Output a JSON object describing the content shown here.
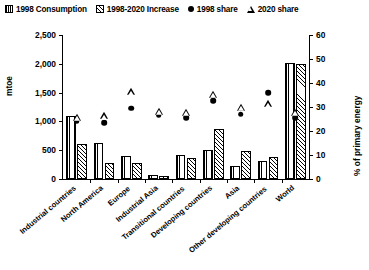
{
  "legend": {
    "items": [
      {
        "label": "1998 Consumption",
        "marker": "vertical-stripe-square"
      },
      {
        "label": "1998-2020 Increase",
        "marker": "diagonal-hatch-square"
      },
      {
        "label": "1998 share",
        "marker": "filled-circle"
      },
      {
        "label": "2020 share",
        "marker": "open-triangle"
      }
    ]
  },
  "axes": {
    "left": {
      "title": "mtoe",
      "ticks": [
        "0",
        "500",
        "1,000",
        "1,500",
        "2,000",
        "2,500"
      ]
    },
    "right": {
      "title": "% of primary energy",
      "ticks": [
        "0",
        "10",
        "20",
        "30",
        "40",
        "50",
        "60"
      ]
    }
  },
  "chart_data": {
    "type": "bar",
    "title": "",
    "xlabel": "",
    "ylabel": "mtoe",
    "y2label": "% of primary energy",
    "ylim": [
      0,
      2500
    ],
    "y2lim": [
      0,
      60
    ],
    "grid": false,
    "legend_position": "top",
    "categories": [
      "Industrial countries",
      "North America",
      "Europe",
      "Industrial Asia",
      "Transitional countries",
      "Developing countries",
      "Asia",
      "Other developing countries",
      "World"
    ],
    "series": [
      {
        "name": "1998 Consumption",
        "axis": "left",
        "units": "mtoe",
        "type": "bar",
        "values": [
          1100,
          630,
          400,
          70,
          420,
          500,
          230,
          320,
          2010
        ]
      },
      {
        "name": "1998-2020 Increase",
        "axis": "left",
        "units": "mtoe",
        "type": "bar",
        "values": [
          610,
          280,
          270,
          50,
          370,
          870,
          490,
          390,
          2000
        ]
      },
      {
        "name": "1998 share",
        "axis": "right",
        "units": "%",
        "type": "marker",
        "values": [
          24.0,
          23.5,
          29.5,
          26.5,
          25.5,
          32.5,
          27.0,
          36.0,
          25.5
        ]
      },
      {
        "name": "2020 share",
        "axis": "right",
        "units": "%",
        "type": "marker",
        "values": [
          26.0,
          26.5,
          36.5,
          28.5,
          28.0,
          35.5,
          30.0,
          31.5,
          28.0
        ]
      }
    ]
  }
}
